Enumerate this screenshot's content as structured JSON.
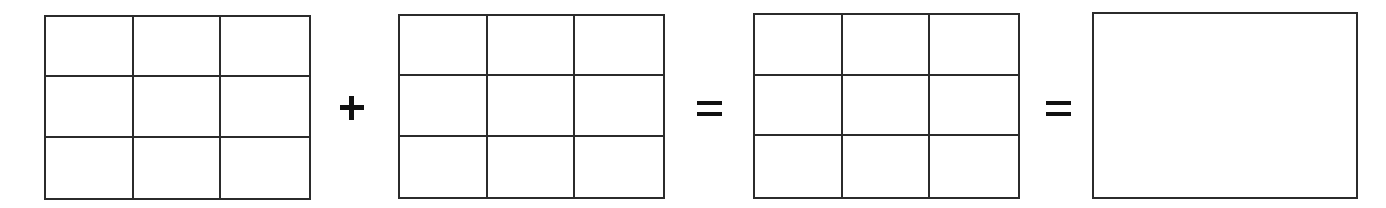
{
  "diagram": {
    "line_color": "#2b2b2b",
    "symbol_color": "#111111",
    "background": "#ffffff",
    "items": [
      {
        "type": "grid",
        "rows": 3,
        "cols": 3,
        "label": "3x3 grid A"
      },
      {
        "type": "operator",
        "symbol": "+",
        "label": "plus"
      },
      {
        "type": "grid",
        "rows": 3,
        "cols": 3,
        "label": "3x3 grid B"
      },
      {
        "type": "operator",
        "symbol": "=",
        "label": "equals"
      },
      {
        "type": "grid",
        "rows": 3,
        "cols": 3,
        "label": "3x3 grid C"
      },
      {
        "type": "operator",
        "symbol": "=",
        "label": "equals"
      },
      {
        "type": "rectangle",
        "rows": 1,
        "cols": 1,
        "label": "single rectangle"
      }
    ]
  }
}
